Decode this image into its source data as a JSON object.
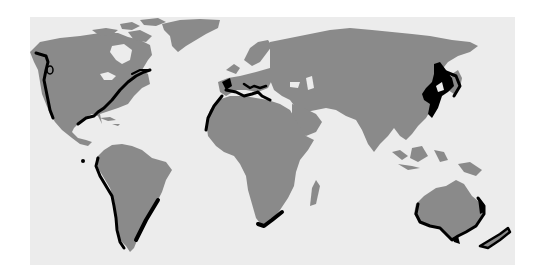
{
  "map": {
    "type": "world-map",
    "projection": "equirectangular",
    "colors": {
      "background": "#ffffff",
      "ocean": "#ececec",
      "land": "#8a8a8a",
      "highlight": "#000000"
    },
    "highlighted_regions": [
      "North America west coast",
      "North America east coast / Gulf of Mexico",
      "Galapagos",
      "South America west coast",
      "South America southeast coast",
      "Mediterranean / Iberia / Northwest Africa",
      "Southern Africa",
      "East Asia (China, Korea, Japan)",
      "Southern Australia",
      "New Zealand"
    ]
  }
}
